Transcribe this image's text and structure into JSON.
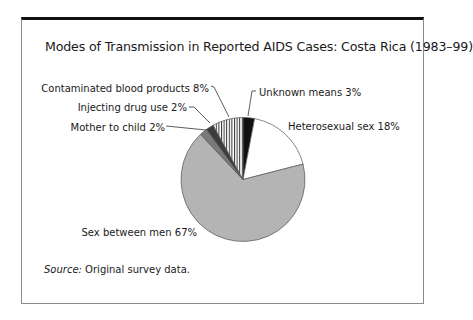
{
  "figure": {
    "title": "Modes of Transmission in Reported AIDS Cases: Costa Rica (1983–99)",
    "source_label": "Source:",
    "source_text": " Original survey data."
  },
  "chart_data": {
    "type": "pie",
    "title": "Modes of Transmission in Reported AIDS Cases: Costa Rica (1983–99)",
    "start_angle_deg": 0,
    "direction": "clockwise",
    "unit": "%",
    "slices": [
      {
        "label": "Unknown means",
        "value": 3,
        "display": "Unknown means 3%",
        "fill": "#111111",
        "pattern": "solid"
      },
      {
        "label": "Heterosexual sex",
        "value": 18,
        "display": "Heterosexual sex 18%",
        "fill": "#ffffff",
        "pattern": "solid"
      },
      {
        "label": "Sex between men",
        "value": 67,
        "display": "Sex between men 67%",
        "fill": "#b4b4b4",
        "pattern": "solid"
      },
      {
        "label": "Mother to child",
        "value": 2,
        "display": "Mother to child 2%",
        "fill": "#7a7a7a",
        "pattern": "solid"
      },
      {
        "label": "Injecting drug use",
        "value": 2,
        "display": "Injecting drug use 2%",
        "fill": "#3c3c3c",
        "pattern": "solid"
      },
      {
        "label": "Contaminated blood products",
        "value": 8,
        "display": "Contaminated blood products 8%",
        "fill": "#ffffff",
        "pattern": "vertical-stripes"
      }
    ],
    "legend": "none (direct labels with leader lines)",
    "source": "Source: Original survey data."
  },
  "colors": {
    "frame_top": "#111111",
    "frame_border": "#8a8a8a",
    "pie_outline": "#555555",
    "stripe": "#333333"
  }
}
